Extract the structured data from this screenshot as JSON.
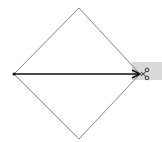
{
  "diagram": {
    "shape": "diamond",
    "diamond": {
      "top": [
        79,
        8
      ],
      "right": [
        140,
        74
      ],
      "bottom": [
        79,
        139
      ],
      "left": [
        14,
        74
      ],
      "stroke": "#555555"
    },
    "arrow": {
      "from": [
        14,
        74
      ],
      "to": [
        140,
        74
      ],
      "stroke": "#111111"
    },
    "highlight": {
      "x": 132,
      "y": 62,
      "width": 30,
      "height": 18,
      "fill": "#d9d9d9"
    },
    "icon": "scissors-icon"
  }
}
